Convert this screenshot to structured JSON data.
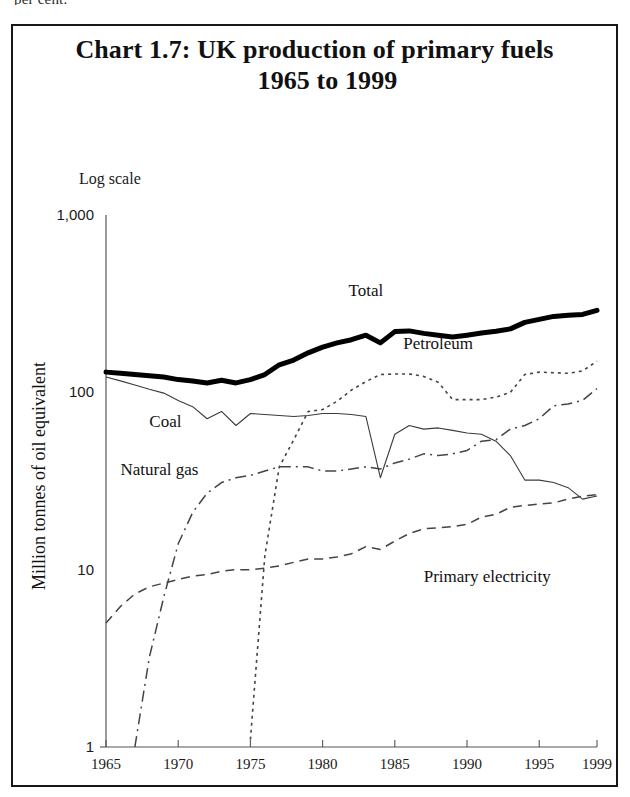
{
  "page": {
    "cut_off_text_above": "per cent."
  },
  "chart_card": {
    "title_line1": "Chart 1.7: UK production of primary fuels",
    "title_line2": "1965 to 1999",
    "scale_note": "Log scale",
    "border_color": "#171717"
  },
  "chart_data": {
    "type": "line",
    "title": "Chart 1.7: UK production of primary fuels 1965 to 1999",
    "subtitle": "Log scale",
    "xlabel": "",
    "ylabel": "Million tonnes of oil equivalent",
    "yscale": "log",
    "ylim": [
      1,
      1000
    ],
    "xlim": [
      1965,
      1999
    ],
    "grid": false,
    "legend_position": "inline-annotations",
    "y_ticks": [
      "1,000",
      "100",
      "10",
      "1"
    ],
    "y_tick_values": [
      1000,
      100,
      10,
      1
    ],
    "x_ticks": [
      "1965",
      "1970",
      "1975",
      "1980",
      "1985",
      "1990",
      "1995",
      "1999"
    ],
    "x_tick_values": [
      1965,
      1970,
      1975,
      1980,
      1985,
      1990,
      1995,
      1999
    ],
    "x": [
      1965,
      1966,
      1967,
      1968,
      1969,
      1970,
      1971,
      1972,
      1973,
      1974,
      1975,
      1976,
      1977,
      1978,
      1979,
      1980,
      1981,
      1982,
      1983,
      1984,
      1985,
      1986,
      1987,
      1988,
      1989,
      1990,
      1991,
      1992,
      1993,
      1994,
      1995,
      1996,
      1997,
      1998,
      1999
    ],
    "series": [
      {
        "name": "Total",
        "label": "Total",
        "line_style": "solid-thick",
        "color": "#000000",
        "values": [
          130,
          128,
          126,
          124,
          122,
          118,
          116,
          113,
          117,
          113,
          118,
          126,
          143,
          152,
          167,
          180,
          190,
          198,
          210,
          190,
          220,
          222,
          215,
          210,
          205,
          210,
          216,
          221,
          228,
          248,
          258,
          268,
          272,
          275,
          290
        ]
      },
      {
        "name": "Coal",
        "label": "Coal",
        "line_style": "solid-thin",
        "color": "#3c3c3c",
        "values": [
          122,
          116,
          110,
          104,
          99,
          90,
          83,
          71,
          78,
          65,
          76,
          75,
          74,
          73,
          74,
          76,
          76,
          75,
          73,
          33,
          58,
          65,
          62,
          63,
          61,
          59,
          58,
          53,
          44,
          32,
          32,
          31,
          29,
          25,
          26
        ]
      },
      {
        "name": "Petroleum",
        "label": "Petroleum",
        "line_style": "dotted",
        "color": "#444444",
        "values": [
          null,
          null,
          null,
          null,
          null,
          null,
          null,
          null,
          null,
          null,
          1.1,
          12,
          38,
          54,
          78,
          80,
          89,
          103,
          115,
          126,
          127,
          127,
          123,
          114,
          91,
          91,
          91,
          94,
          100,
          126,
          130,
          129,
          128,
          132,
          150
        ]
      },
      {
        "name": "Natural gas",
        "label": "Natural gas",
        "line_style": "dash-dot",
        "color": "#444444",
        "values": [
          null,
          null,
          1.0,
          3.2,
          7.0,
          14,
          21,
          27,
          31,
          33,
          34,
          36,
          38,
          38,
          38,
          36,
          36,
          37,
          38,
          37,
          40,
          42,
          45,
          44,
          45,
          47,
          53,
          54,
          62,
          65,
          71,
          84,
          86,
          90,
          105
        ]
      },
      {
        "name": "Primary electricity",
        "label": "Primary electricity",
        "line_style": "dashed",
        "color": "#444444",
        "values": [
          5.0,
          6.2,
          7.3,
          8.0,
          8.4,
          8.8,
          9.2,
          9.4,
          9.8,
          10.0,
          10.0,
          10.2,
          10.5,
          11.0,
          11.5,
          11.5,
          11.8,
          12.3,
          13.5,
          13.0,
          14.5,
          16.0,
          17.0,
          17.2,
          17.5,
          18.0,
          19.8,
          20.5,
          22.5,
          23.0,
          23.5,
          23.8,
          25.0,
          26.0,
          26.5
        ]
      }
    ],
    "annotations": [
      {
        "text": "Total",
        "x": 1983,
        "y": 350
      },
      {
        "text": "Petroleum",
        "x": 1988,
        "y": 175
      },
      {
        "text": "Coal",
        "x": 1968,
        "y": 64
      },
      {
        "text": "Natural gas",
        "x": 1966,
        "y": 34
      },
      {
        "text": "Primary electricity",
        "x": 1987,
        "y": 8.5
      },
      {
        "text": "Log scale",
        "x": 1966,
        "y": 1400
      }
    ]
  }
}
